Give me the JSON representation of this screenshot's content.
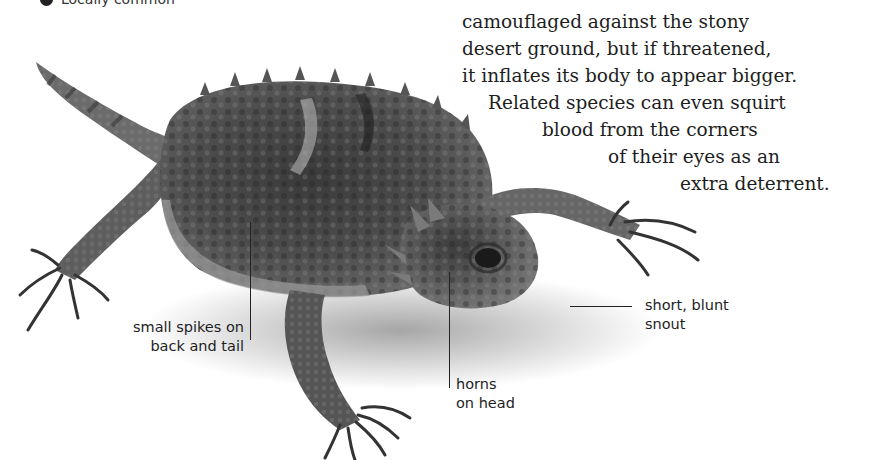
{
  "legend": {
    "icon": "filled-circle-icon",
    "color": "#222222",
    "label": "Locally common"
  },
  "description": {
    "lines": [
      "camouflaged against the stony",
      "desert ground, but if threatened,",
      "it inflates its body to appear bigger.",
      "Related species can even squirt",
      "blood from the corners",
      "of their eyes as an",
      "extra deterrent."
    ]
  },
  "photo": {
    "subject": "horned lizard",
    "style": "grayscale cut-out photograph"
  },
  "callouts": [
    {
      "id": "spikes",
      "lines": [
        "small spikes on",
        "back and tail"
      ]
    },
    {
      "id": "horns",
      "lines": [
        "horns",
        "on head"
      ]
    },
    {
      "id": "snout",
      "lines": [
        "short, blunt",
        "snout"
      ]
    }
  ]
}
